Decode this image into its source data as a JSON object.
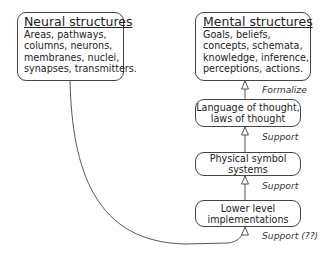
{
  "neural": {
    "title": "Neural structures",
    "lines": [
      "Areas, pathways,",
      "columns, neurons,",
      "membranes, nuclei,",
      "synapses, transmitters."
    ]
  },
  "mental": {
    "title": "Mental structures",
    "lines": [
      "Goals, beliefs,",
      "concepts, schemata,",
      "knowledge, inference,",
      "perceptions, actions."
    ]
  },
  "levels": [
    {
      "lines": [
        "Language of thought,",
        "laws of thought"
      ]
    },
    {
      "lines": [
        "Physical symbol",
        "systems"
      ]
    },
    {
      "lines": [
        "Lower level",
        "implementations"
      ]
    }
  ],
  "arrows": [
    {
      "label": "Formalize"
    },
    {
      "label": "Support"
    },
    {
      "label": "Support"
    },
    {
      "label": "Support (??)"
    }
  ],
  "colors": {
    "stroke": "#444444",
    "background": "#ffffff"
  }
}
